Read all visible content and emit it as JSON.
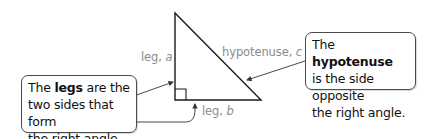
{
  "diagram": {
    "colors": {
      "triangle": "#1a1a1a",
      "label": "#8c8c8c",
      "callout_border": "#4a4a4a",
      "text": "#111111"
    },
    "labels": {
      "leg_a": {
        "prefix": "leg, ",
        "var": "a"
      },
      "hypotenuse_c": {
        "prefix": "hypotenuse, ",
        "var": "c"
      },
      "leg_b": {
        "prefix": "leg, ",
        "var": "b"
      }
    },
    "callouts": {
      "legs": {
        "pre": "The ",
        "term": "legs",
        "post": " are the",
        "line2": "two sides that form",
        "line3": "the right angle."
      },
      "hypotenuse": {
        "pre": "The ",
        "term": "hypotenuse",
        "line2": "is the side opposite",
        "line3": "the right angle."
      }
    }
  }
}
